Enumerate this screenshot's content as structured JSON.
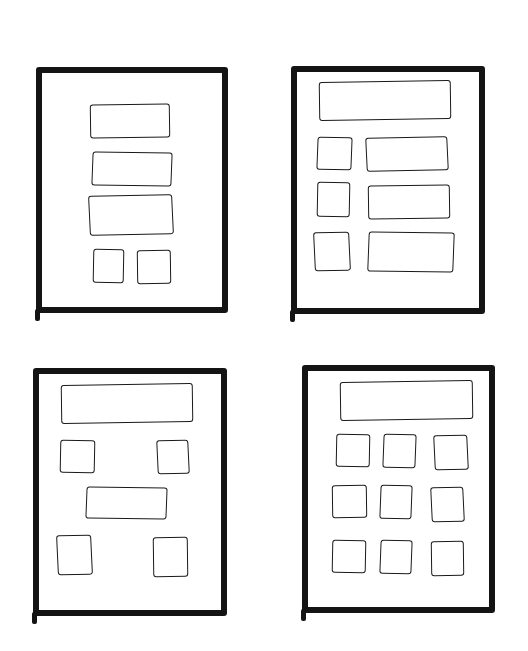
{
  "diagram": {
    "title": "",
    "stroke_color": "#141414",
    "background_color": "#ffffff",
    "sketches": [
      {
        "id": "sketch-1",
        "position": "top-left",
        "layout": "three stacked wide blocks followed by two small squares",
        "elements": [
          "wide-block",
          "wide-block",
          "wide-block",
          "small-square",
          "small-square"
        ]
      },
      {
        "id": "sketch-2",
        "position": "top-right",
        "layout": "header bar followed by three rows of small square plus wide block",
        "elements": [
          "header-bar",
          "small-square",
          "wide-block",
          "small-square",
          "wide-block",
          "small-square",
          "wide-block"
        ]
      },
      {
        "id": "sketch-3",
        "position": "bottom-left",
        "layout": "header bar, two corner squares, centered block, two corner squares",
        "elements": [
          "header-bar",
          "small-square",
          "small-square",
          "center-block",
          "small-square",
          "small-square"
        ]
      },
      {
        "id": "sketch-4",
        "position": "bottom-right",
        "layout": "header bar followed by a 3x3 grid of squares",
        "elements": [
          "header-bar",
          "square",
          "square",
          "square",
          "square",
          "square",
          "square",
          "square",
          "square",
          "square"
        ]
      }
    ]
  }
}
